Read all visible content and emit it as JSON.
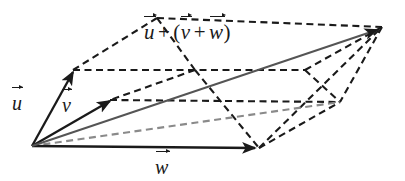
{
  "figure": {
    "background_color": "#ffffff",
    "stroke_color": "#1a1a1a",
    "gray_stroke_color": "#8a8a8a",
    "labels": {
      "sum": {
        "u": "u",
        "plus_1": "+",
        "open_paren": "(",
        "v": "v",
        "plus_2": "+",
        "w": "w",
        "close_paren": ")",
        "full_text": "u + (v + w)"
      },
      "u": "u",
      "v": "v",
      "w": "w"
    },
    "geometry": {
      "origin": [
        32,
        146
      ],
      "u_tip": [
        73,
        70
      ],
      "v_tip": [
        110,
        100
      ],
      "w_tip": [
        259,
        148
      ],
      "apex": [
        382,
        27
      ],
      "top_left_vertex": [
        157,
        18
      ],
      "right_mid_vertex": [
        340,
        102
      ],
      "upper_right_vertex": [
        305,
        70
      ],
      "upper_mid_vertex": [
        195,
        70
      ]
    }
  }
}
